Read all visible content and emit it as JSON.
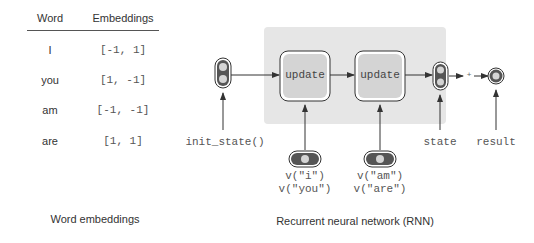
{
  "table": {
    "headers": [
      "Word",
      "Embeddings"
    ],
    "rows": [
      {
        "word": "I",
        "embedding": "[-1, 1]"
      },
      {
        "word": "you",
        "embedding": "[1, -1]"
      },
      {
        "word": "am",
        "embedding": "[-1, -1]"
      },
      {
        "word": "are",
        "embedding": "[1, 1]"
      }
    ],
    "caption": "Word embeddings"
  },
  "rnn": {
    "caption": "Recurrent neural network (RNN)",
    "init_label": "init_state()",
    "update_labels": [
      "update",
      "update"
    ],
    "input_labels": [
      [
        "v(\"i\")",
        "v(\"you\")"
      ],
      [
        "v(\"am\")",
        "v(\"are\")"
      ]
    ],
    "state_label": "state",
    "result_label": "result",
    "plus_label": "+",
    "colors": {
      "shade": "#e6e6e6",
      "node_fill": "#d4d4d4",
      "node_dark": "#555555",
      "stroke": "#333333"
    }
  }
}
